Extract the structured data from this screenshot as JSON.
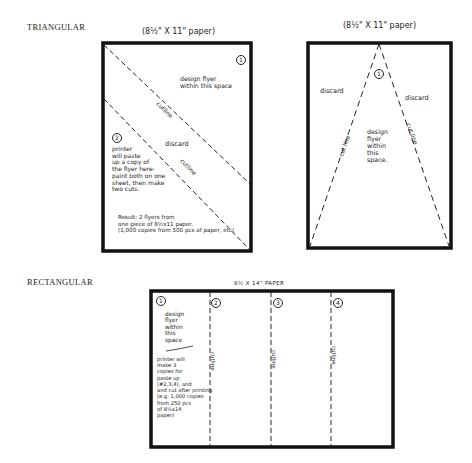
{
  "sections": {
    "triangular": {
      "label": "TRIANGULAR"
    },
    "rectangular": {
      "label": "RECTANGULAR"
    }
  },
  "panels": {
    "left_triangle": {
      "caption": "(8½\" X 11\" paper)",
      "piece_1_number": "1",
      "piece_1_text": "design flyer\nwithin this space",
      "cut_line_label": "cutline",
      "piece_2_number": "2",
      "discard_label": "discard",
      "cut_line_label_2": "cutline",
      "printer_note": "printer\nwill paste\nup a copy of\nthe flyer here-\npaint both on one\nsheet, then make\ntwo cuts.",
      "result_note": "Result: 2 flyers from\none piece of 8½x11 paper.\n(1,000 copies from 500 pcs of paper, etc)"
    },
    "right_triangle": {
      "caption": "(8½\" X 11\" paper)",
      "piece_number": "1",
      "discard_left": "discard",
      "discard_right": "discard",
      "cut_line_left": "cut line",
      "cut_line_right": "cut line",
      "design_text": "design\nflyer\nwithin\nthis\nspace."
    },
    "rectangle": {
      "caption": "8½ X 14\" PAPER",
      "piece_numbers": [
        "1",
        "2",
        "3",
        "4"
      ],
      "design_text": "design\nflyer\nwithin\nthis\nspace",
      "printer_note": "printer will\nmake 3\ncopies for\npaste up\n(#2,3,4), and\nand cut after printing\n(e.g. 1,000 copies\nfrom 250 pcs\nof 8½x14\npaper)",
      "cut_labels": [
        "cutline",
        "cutline",
        "cutline"
      ]
    }
  }
}
